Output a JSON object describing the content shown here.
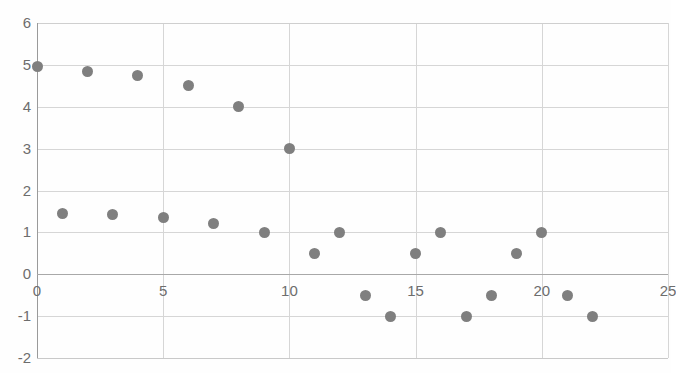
{
  "chart_data": {
    "type": "scatter",
    "title": "",
    "xlabel": "",
    "ylabel": "",
    "xlim": [
      0,
      25
    ],
    "ylim": [
      -2,
      6
    ],
    "xticks": [
      0,
      5,
      10,
      15,
      20,
      25
    ],
    "yticks": [
      6,
      5,
      4,
      3,
      2,
      1,
      0,
      -1,
      -2
    ],
    "grid": true,
    "legend": "none",
    "marker_color": "#7f7f7f",
    "series": [
      {
        "name": "upper-descending",
        "points": [
          {
            "x": 0,
            "y": 4.95
          },
          {
            "x": 2,
            "y": 4.85
          },
          {
            "x": 4,
            "y": 4.75
          },
          {
            "x": 6,
            "y": 4.5
          },
          {
            "x": 8,
            "y": 4.0
          },
          {
            "x": 10,
            "y": 3.0
          }
        ]
      },
      {
        "name": "lower-decaying",
        "points": [
          {
            "x": 1,
            "y": 1.45
          },
          {
            "x": 3,
            "y": 1.42
          },
          {
            "x": 5,
            "y": 1.35
          },
          {
            "x": 7,
            "y": 1.22
          },
          {
            "x": 9,
            "y": 1.0
          },
          {
            "x": 11,
            "y": 0.5
          },
          {
            "x": 12,
            "y": 1.0
          },
          {
            "x": 13,
            "y": -0.5
          },
          {
            "x": 14,
            "y": -1.0
          },
          {
            "x": 15,
            "y": 0.5
          },
          {
            "x": 16,
            "y": 1.0
          },
          {
            "x": 17,
            "y": -1.0
          },
          {
            "x": 18,
            "y": -0.5
          },
          {
            "x": 19,
            "y": 0.5
          },
          {
            "x": 20,
            "y": 1.0
          },
          {
            "x": 21,
            "y": -0.5
          },
          {
            "x": 22,
            "y": -1.0
          }
        ]
      }
    ]
  },
  "axis": {
    "y_tick_labels": [
      "6",
      "5",
      "4",
      "3",
      "2",
      "1",
      "0",
      "-1",
      "-2"
    ],
    "x_tick_labels": [
      "0",
      "5",
      "10",
      "15",
      "20",
      "25"
    ]
  }
}
